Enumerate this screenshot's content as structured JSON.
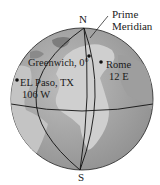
{
  "diagram": {
    "type": "globe-longitude",
    "poles": {
      "north": "N",
      "south": "S"
    },
    "prime_meridian": {
      "line1": "Prime",
      "line2": "Meridian"
    },
    "locations": [
      {
        "name": "Greenwich, 0°",
        "line1": "Greenwich, 0°"
      },
      {
        "name": "Rome",
        "line1": "Rome",
        "line2": "12 E"
      },
      {
        "name": "EL Paso, TX",
        "line1": "EL Paso, TX",
        "line2": "106 W"
      }
    ],
    "colors": {
      "ocean": "#a8a8a8",
      "land": "#cfcfcf",
      "dark_land": "#8a8a8a",
      "lines": "#111111",
      "text": "#1a1a1a"
    }
  }
}
